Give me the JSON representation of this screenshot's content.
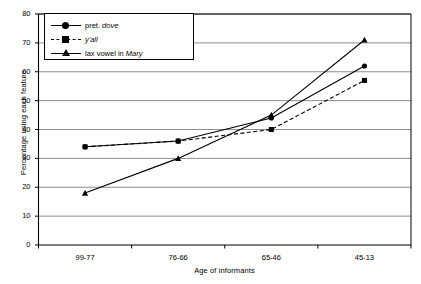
{
  "chart_data": {
    "type": "line",
    "title": "",
    "xlabel": "Age of informants",
    "ylabel": "Percentage using each feature",
    "categories": [
      "99-77",
      "76-66",
      "65-46",
      "45-13"
    ],
    "ylim": [
      0,
      80
    ],
    "yticks": [
      0,
      10,
      20,
      30,
      40,
      50,
      60,
      70,
      80
    ],
    "grid": true,
    "legend_position": "top-left",
    "series": [
      {
        "name": "pret. dove",
        "name_plain": "pret. ",
        "name_italic": "dove",
        "marker": "circle",
        "linestyle": "solid",
        "color": "#000000",
        "values": [
          34,
          36,
          44,
          62
        ]
      },
      {
        "name": "y'all",
        "name_plain": "",
        "name_italic": "y'all",
        "marker": "square",
        "linestyle": "dashed",
        "color": "#000000",
        "values": [
          34,
          36,
          40,
          57
        ]
      },
      {
        "name": "lax vowel in Mary",
        "name_plain": "lax vowel in ",
        "name_italic": "Mary",
        "marker": "triangle",
        "linestyle": "solid",
        "color": "#000000",
        "values": [
          18,
          30,
          45,
          71
        ]
      }
    ]
  },
  "axes": {
    "y_tick_labels": [
      "0",
      "10",
      "20",
      "30",
      "40",
      "50",
      "60",
      "70",
      "80"
    ],
    "x_tick_labels": [
      "99-77",
      "76-66",
      "65-46",
      "45-13"
    ],
    "y_title": "Percentage using each feature",
    "x_title": "Age of informants"
  },
  "legend": {
    "items": [
      {
        "label_plain": "pret. ",
        "label_italic": "dove"
      },
      {
        "label_plain": "",
        "label_italic": "y'all"
      },
      {
        "label_plain": "lax vowel in ",
        "label_italic": "Mary"
      }
    ]
  },
  "colors": {
    "ink": "#000000",
    "grid": "#808080",
    "background": "#ffffff"
  }
}
